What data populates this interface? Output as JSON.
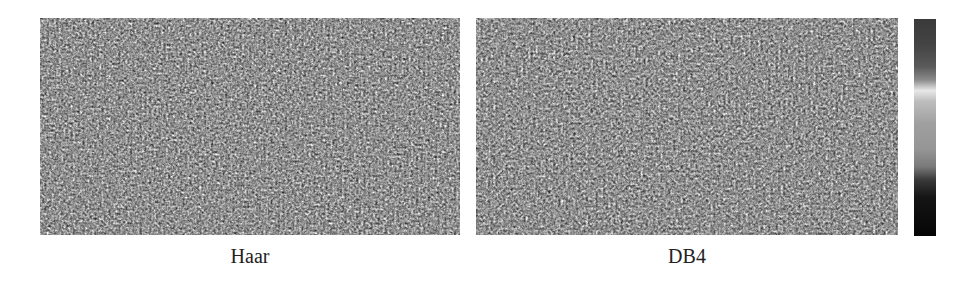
{
  "figure": {
    "panels": [
      {
        "id": "haar",
        "label": "Haar",
        "texture": "speckle-noise",
        "base_color": "#111111"
      },
      {
        "id": "db4",
        "label": "DB4",
        "texture": "speckle-noise",
        "base_color": "#111111"
      }
    ],
    "colorbar": {
      "orientation": "vertical",
      "colormap_stops": [
        "#3a3a3a",
        "#5a5a5a",
        "#e8e8e8",
        "#a0a0a0",
        "#7a7a7a",
        "#151515",
        "#050505"
      ],
      "tick_labels": []
    }
  }
}
